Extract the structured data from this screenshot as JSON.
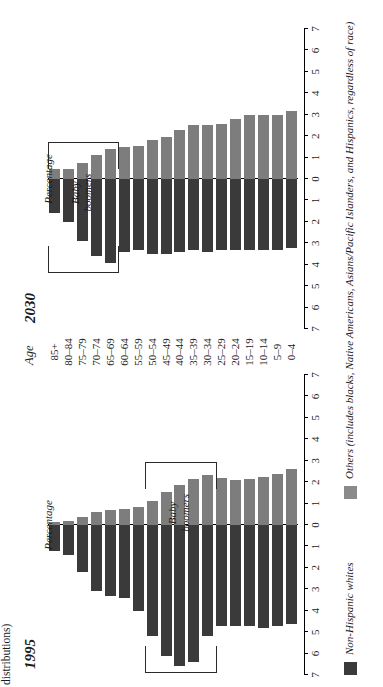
{
  "caption": "distributions)",
  "age_axis": {
    "title": "Age",
    "groups": [
      "85+",
      "80–84",
      "75–79",
      "70–74",
      "65–69",
      "60–64",
      "55–59",
      "50–54",
      "45–49",
      "40–44",
      "35–39",
      "30–34",
      "25–29",
      "20–24",
      "15–19",
      "10–14",
      "5–9",
      "0–4"
    ]
  },
  "axis": {
    "label": "Percentage",
    "ticks": [
      "7",
      "6",
      "5",
      "4",
      "3",
      "2",
      "1",
      "0",
      "1",
      "2",
      "3",
      "4",
      "5",
      "6",
      "7"
    ],
    "range": [
      -7,
      7
    ]
  },
  "annotation": {
    "bracket_label_line1": "Baby",
    "bracket_label_line2": "boomers"
  },
  "legend": {
    "items": [
      {
        "label": "Non-Hispanic whites",
        "color": "#3a3a3a",
        "swatch": "dark-swatch"
      },
      {
        "label": "Others (includes blacks, Native Americans, Asians/Pacific Islanders, and Hispanics, regardless of race)",
        "color": "#8a8a8a",
        "swatch": "grey-swatch"
      }
    ]
  },
  "chart_data": {
    "type": "bar",
    "xlabel": "Percentage",
    "ylabel": "Age",
    "xlim": [
      -7,
      7
    ],
    "grid": false,
    "legend_position": "bottom",
    "categories": [
      "85+",
      "80–84",
      "75–79",
      "70–74",
      "65–69",
      "60–64",
      "55–59",
      "50–54",
      "45–49",
      "40–44",
      "35–39",
      "30–34",
      "25–29",
      "20–24",
      "15–19",
      "10–14",
      "5–9",
      "0–4"
    ],
    "panels": [
      {
        "name": "1995",
        "baby_boomers_groups": [
          "50–54",
          "45–49",
          "40–44",
          "35–39",
          "30–34"
        ],
        "series": [
          {
            "name": "Non-Hispanic whites",
            "color": "#3a3a3a",
            "side": "left",
            "values": [
              1.2,
              1.4,
              2.2,
              3.1,
              3.3,
              3.4,
              4.0,
              5.2,
              6.1,
              6.6,
              6.4,
              5.2,
              4.7,
              4.7,
              4.7,
              4.8,
              4.7,
              4.6
            ]
          },
          {
            "name": "Others",
            "color": "#7d7d7d",
            "side": "right",
            "values": [
              0.15,
              0.2,
              0.35,
              0.6,
              0.7,
              0.75,
              0.85,
              1.1,
              1.55,
              1.85,
              2.15,
              2.35,
              2.2,
              2.1,
              2.15,
              2.25,
              2.4,
              2.6
            ]
          }
        ]
      },
      {
        "name": "2030",
        "baby_boomers_groups": [
          "85+",
          "80–84",
          "75–79",
          "70–74",
          "65–69"
        ],
        "series": [
          {
            "name": "Non-Hispanic whites",
            "color": "#3a3a3a",
            "side": "left",
            "values": [
              1.6,
              2.0,
              2.9,
              3.6,
              3.9,
              3.4,
              3.3,
              3.5,
              3.5,
              3.4,
              3.3,
              3.4,
              3.3,
              3.3,
              3.3,
              3.3,
              3.3,
              3.2
            ]
          },
          {
            "name": "Others",
            "color": "#7d7d7d",
            "side": "right",
            "values": [
              0.45,
              0.45,
              0.75,
              1.1,
              1.4,
              1.5,
              1.55,
              1.8,
              1.95,
              2.3,
              2.5,
              2.5,
              2.55,
              2.8,
              3.0,
              3.0,
              3.0,
              3.15
            ]
          }
        ]
      }
    ]
  }
}
